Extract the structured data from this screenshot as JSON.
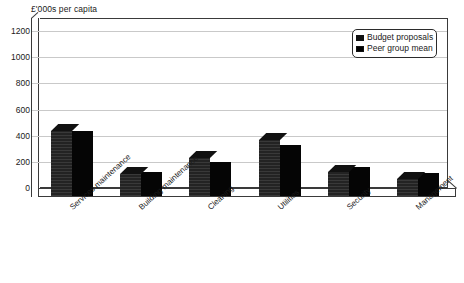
{
  "chart_data": {
    "type": "bar",
    "title": "",
    "ylabel": "£'000s per capita",
    "xlabel": "",
    "ylim": [
      0,
      1300
    ],
    "yticks": [
      0,
      200,
      400,
      600,
      800,
      1000,
      1200
    ],
    "ytick_labels": [
      "0",
      "200",
      "400",
      "600",
      "800",
      "1000",
      "1200"
    ],
    "grid": true,
    "legend_position": "top-right",
    "style": "3d-grouped-bar",
    "categories": [
      "Services maintenance",
      "Building maintenance",
      "Cleaning",
      "Utilities",
      "Security",
      "Management"
    ],
    "series": [
      {
        "name": "Budget proposals",
        "color": "#232323",
        "values": [
          500,
          165,
          290,
          430,
          180,
          130
        ]
      },
      {
        "name": "Peer group mean",
        "color": "#050505",
        "values": [
          500,
          180,
          260,
          390,
          220,
          175
        ]
      }
    ]
  },
  "legend": {
    "entries": [
      {
        "label": "Budget proposals",
        "swatch_color": "#232323"
      },
      {
        "label": "Peer group mean",
        "swatch_color": "#050505"
      }
    ]
  },
  "axis": {
    "y_title": "£'000s per capita"
  }
}
